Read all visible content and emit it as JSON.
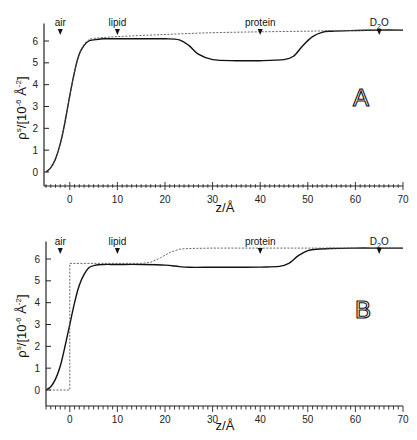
{
  "chart_data": [
    {
      "type": "line",
      "panel": "A",
      "title": "",
      "xlabel": "z/Å",
      "ylabel": "ρs/[10-6 Å-2]",
      "xlim": [
        -5,
        70
      ],
      "ylim": [
        0,
        6.5
      ],
      "x_ticks": [
        0,
        10,
        20,
        30,
        40,
        50,
        60,
        70
      ],
      "y_ticks": [
        0,
        1,
        2,
        3,
        4,
        5,
        6
      ],
      "grid": false,
      "annotations": [
        {
          "label": "air",
          "x": -2
        },
        {
          "label": "lipid",
          "x": 10
        },
        {
          "label": "protein",
          "x": 40
        },
        {
          "label": "D2O",
          "x": 65
        }
      ],
      "series": [
        {
          "name": "solid",
          "style": "solid",
          "x": [
            -5,
            -4,
            -3,
            -2,
            -1,
            0,
            1,
            2,
            3,
            4,
            5,
            7,
            10,
            15,
            20,
            23,
            25,
            27,
            30,
            35,
            40,
            45,
            47,
            49,
            51,
            53,
            55,
            60,
            65,
            70
          ],
          "y": [
            0.0,
            0.2,
            0.6,
            1.3,
            2.3,
            3.5,
            4.6,
            5.4,
            5.8,
            6.0,
            6.05,
            6.1,
            6.1,
            6.1,
            6.1,
            6.05,
            5.8,
            5.4,
            5.15,
            5.1,
            5.1,
            5.15,
            5.3,
            5.8,
            6.2,
            6.4,
            6.45,
            6.48,
            6.5,
            6.5
          ]
        },
        {
          "name": "dashed",
          "style": "dashed",
          "x": [
            -5,
            -4,
            -3,
            -2,
            -1,
            0,
            1,
            2,
            3,
            4,
            5,
            10,
            20,
            30,
            40,
            50,
            55,
            60,
            65,
            70
          ],
          "y": [
            0.0,
            0.2,
            0.6,
            1.3,
            2.3,
            3.5,
            4.6,
            5.4,
            5.85,
            6.05,
            6.12,
            6.2,
            6.3,
            6.38,
            6.42,
            6.45,
            6.47,
            6.48,
            6.5,
            6.5
          ]
        }
      ]
    },
    {
      "type": "line",
      "panel": "B",
      "title": "",
      "xlabel": "z/Å",
      "ylabel": "ρs/[10-6 Å-2]",
      "xlim": [
        -5,
        70
      ],
      "ylim": [
        0,
        6.5
      ],
      "x_ticks": [
        0,
        10,
        20,
        30,
        40,
        50,
        60,
        70
      ],
      "y_ticks": [
        0,
        1,
        2,
        3,
        4,
        5,
        6
      ],
      "grid": false,
      "annotations": [
        {
          "label": "air",
          "x": -2
        },
        {
          "label": "lipid",
          "x": 10
        },
        {
          "label": "protein",
          "x": 40
        },
        {
          "label": "D2O",
          "x": 65
        }
      ],
      "series": [
        {
          "name": "solid",
          "style": "solid",
          "x": [
            -5,
            -4,
            -3,
            -2,
            -1,
            0,
            1,
            2,
            3,
            4,
            5,
            7,
            10,
            15,
            20,
            23,
            25,
            30,
            35,
            40,
            44,
            46,
            48,
            50,
            52,
            55,
            60,
            65,
            70
          ],
          "y": [
            0.0,
            0.15,
            0.5,
            1.1,
            2.0,
            3.0,
            4.0,
            4.8,
            5.3,
            5.6,
            5.7,
            5.75,
            5.75,
            5.75,
            5.72,
            5.65,
            5.62,
            5.62,
            5.62,
            5.63,
            5.66,
            5.8,
            6.15,
            6.38,
            6.45,
            6.48,
            6.5,
            6.5,
            6.5
          ]
        },
        {
          "name": "dashed",
          "style": "dashed",
          "x": [
            -5,
            -0.01,
            0,
            5,
            10,
            15,
            17,
            19,
            21,
            23,
            25,
            30,
            40,
            47,
            50,
            55,
            60,
            65,
            70
          ],
          "y": [
            0.0,
            0.0,
            5.8,
            5.8,
            5.8,
            5.8,
            5.85,
            6.05,
            6.3,
            6.45,
            6.48,
            6.5,
            6.5,
            6.5,
            6.5,
            6.5,
            6.5,
            6.5,
            6.5
          ]
        }
      ]
    }
  ],
  "panels": [
    {
      "letter": "A",
      "markers": {
        "air": "air",
        "lipid": "lipid",
        "protein": "protein",
        "d2o_main": "D",
        "d2o_sub": "2",
        "d2o_end": "O"
      },
      "xlabel": "z/Å",
      "ylabel_rho": "ρ",
      "ylabel_sup": "s",
      "ylabel_rest": "/[10",
      "ylabel_exp1": "-6",
      "ylabel_unit": " Å",
      "ylabel_exp2": "-2",
      "ylabel_close": "]",
      "x_tick_labels": [
        "0",
        "10",
        "20",
        "30",
        "40",
        "50",
        "60",
        "70"
      ],
      "y_tick_labels": [
        "0",
        "1",
        "2",
        "3",
        "4",
        "5",
        "6"
      ]
    },
    {
      "letter": "B",
      "markers": {
        "air": "air",
        "lipid": "lipid",
        "protein": "protein",
        "d2o_main": "D",
        "d2o_sub": "2",
        "d2o_end": "O"
      },
      "xlabel": "z/Å",
      "ylabel_rho": "ρ",
      "ylabel_sup": "s",
      "ylabel_rest": "/[10",
      "ylabel_exp1": "-6",
      "ylabel_unit": " Å",
      "ylabel_exp2": "-2",
      "ylabel_close": "]",
      "x_tick_labels": [
        "0",
        "10",
        "20",
        "30",
        "40",
        "50",
        "60",
        "70"
      ],
      "y_tick_labels": [
        "0",
        "1",
        "2",
        "3",
        "4",
        "5",
        "6"
      ]
    }
  ],
  "colors": {
    "line": "#111111",
    "dashed": "#555555",
    "axis": "#222222",
    "background": "#ffffff"
  }
}
